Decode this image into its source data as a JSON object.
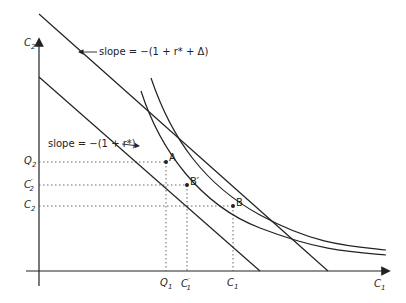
{
  "diagram": {
    "y_axis_label": "C",
    "y_axis_sub": "2",
    "x_axis_label": "C",
    "x_axis_sub": "1",
    "steep_slope_label": "slope = −(1 + r* + Δ)",
    "flat_slope_label": "slope = −(1 + r*)",
    "y_ticks": [
      {
        "main": "Q",
        "sub": "2"
      },
      {
        "main": "C",
        "sub": "2",
        "prime": "′"
      },
      {
        "main": "C",
        "sub": "2"
      }
    ],
    "x_ticks": [
      {
        "main": "Q",
        "sub": "1"
      },
      {
        "main": "C",
        "sub": "1",
        "prime": "′"
      },
      {
        "main": "C",
        "sub": "1"
      }
    ],
    "points": [
      {
        "label": "A"
      },
      {
        "label": "B′"
      },
      {
        "label": "B"
      }
    ],
    "colors": {
      "line": "#222222",
      "dotted": "#555555"
    }
  }
}
